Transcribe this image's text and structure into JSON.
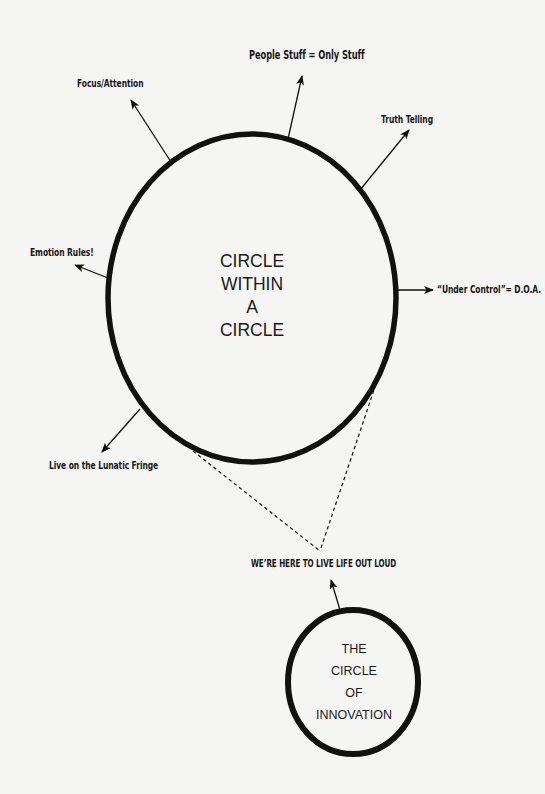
{
  "diagram": {
    "main_circle": {
      "lines": [
        "CIRCLE",
        "WITHIN",
        "A",
        "CIRCLE"
      ]
    },
    "small_circle": {
      "lines": [
        "THE",
        "CIRCLE",
        "OF",
        "INNOVATION"
      ]
    },
    "labels": {
      "people_stuff": "People Stuff = Only Stuff",
      "focus_attention": "Focus/Attention",
      "truth_telling": "Truth Telling",
      "emotion_rules": "Emotion Rules!",
      "under_control": "“Under Control”= D.O.A.",
      "lunatic_fringe": "Live on the Lunatic Fringe",
      "live_out_loud": "WE’RE HERE TO LIVE LIFE OUT LOUD"
    },
    "colors": {
      "ink": "#111111",
      "paper": "#f5f5f3"
    }
  }
}
